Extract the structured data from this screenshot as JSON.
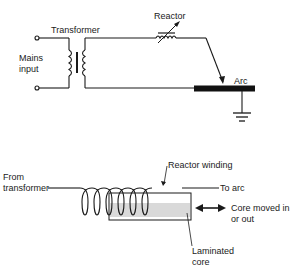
{
  "circuit_diagram": {
    "labels": {
      "transformer": "Transformer",
      "reactor": "Reactor",
      "mains_line1": "Mains",
      "mains_line2": "input",
      "arc": "Arc"
    },
    "components": [
      "mains-input-terminals",
      "transformer",
      "variable-reactor",
      "electrode",
      "arc-workpiece",
      "ground"
    ]
  },
  "reactor_detail": {
    "labels": {
      "from_line1": "From",
      "from_line2": "transformer",
      "reactor_winding": "Reactor winding",
      "to_arc": "To arc",
      "core_moved_line1": "Core moved in",
      "core_moved_line2": "or out",
      "laminated_line1": "Laminated",
      "laminated_line2": "core"
    },
    "colors": {
      "core_fill": "#d9d9d9",
      "ink": "#1a1a1a"
    }
  }
}
